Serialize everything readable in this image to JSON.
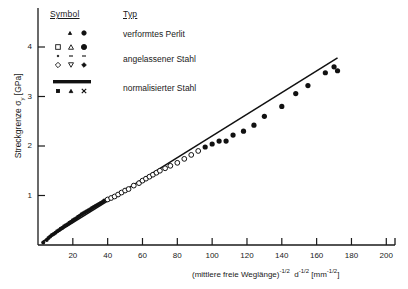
{
  "chart_data": {
    "type": "scatter",
    "title": "",
    "xlabel": "(mittlere freie Weglänge)-1/2  d-1/2 [mm-1/2]",
    "xlabel_parts": {
      "base1": "(mittlere freie Weglänge)",
      "exp1": "-1/2",
      "base2": "d",
      "exp2": "-1/2",
      "unit_open": "[mm",
      "unit_exp": "-1/2",
      "unit_close": "]"
    },
    "ylabel": "Streckgrenze σy [GPa]",
    "ylabel_parts": {
      "base": "Streckgrenze σ",
      "sub": "y",
      "unit": " [GPa]"
    },
    "xlim": [
      0,
      205
    ],
    "ylim": [
      0,
      4.35
    ],
    "xticks": [
      20,
      40,
      60,
      80,
      100,
      120,
      140,
      160,
      180,
      200
    ],
    "yticks": [
      1,
      2,
      3,
      4
    ],
    "grid": false,
    "legend_position": "upper-left-inside",
    "trendline": {
      "x": [
        3,
        172
      ],
      "y": [
        0.08,
        3.78
      ],
      "slope": 0.0219,
      "intercept": 0.014
    },
    "series": [
      {
        "name": "verformtes Perlit",
        "marker": "filled-small",
        "points": [
          [
            3,
            0.05
          ],
          [
            5,
            0.1
          ],
          [
            6,
            0.14
          ],
          [
            7,
            0.17
          ],
          [
            8,
            0.2
          ],
          [
            9,
            0.22
          ],
          [
            10,
            0.25
          ],
          [
            11,
            0.28
          ],
          [
            12,
            0.3
          ],
          [
            13,
            0.33
          ],
          [
            14,
            0.35
          ],
          [
            15,
            0.38
          ],
          [
            16,
            0.4
          ],
          [
            17,
            0.42
          ],
          [
            18,
            0.45
          ],
          [
            19,
            0.47
          ],
          [
            20,
            0.5
          ],
          [
            21,
            0.52
          ],
          [
            22,
            0.54
          ],
          [
            23,
            0.57
          ],
          [
            24,
            0.59
          ],
          [
            25,
            0.62
          ],
          [
            26,
            0.64
          ],
          [
            27,
            0.66
          ],
          [
            28,
            0.68
          ],
          [
            29,
            0.7
          ],
          [
            30,
            0.72
          ],
          [
            31,
            0.75
          ],
          [
            32,
            0.77
          ],
          [
            33,
            0.79
          ],
          [
            34,
            0.81
          ],
          [
            35,
            0.83
          ],
          [
            36,
            0.85
          ],
          [
            37,
            0.87
          ],
          [
            38,
            0.9
          ]
        ]
      },
      {
        "name": "angelassener Stahl",
        "marker": "open",
        "points": [
          [
            40,
            0.92
          ],
          [
            42,
            0.95
          ],
          [
            44,
            0.98
          ],
          [
            46,
            1.02
          ],
          [
            48,
            1.06
          ],
          [
            50,
            1.1
          ],
          [
            52,
            1.13
          ],
          [
            55,
            1.2
          ],
          [
            58,
            1.25
          ],
          [
            60,
            1.3
          ],
          [
            62,
            1.34
          ],
          [
            64,
            1.38
          ],
          [
            66,
            1.42
          ],
          [
            68,
            1.46
          ],
          [
            70,
            1.5
          ],
          [
            73,
            1.55
          ],
          [
            76,
            1.6
          ],
          [
            80,
            1.66
          ],
          [
            84,
            1.74
          ],
          [
            88,
            1.82
          ],
          [
            92,
            1.9
          ]
        ]
      },
      {
        "name": "normalisierter Stahl",
        "marker": "filled",
        "points": [
          [
            96,
            1.98
          ],
          [
            100,
            2.04
          ],
          [
            104,
            2.1
          ],
          [
            108,
            2.1
          ],
          [
            112,
            2.22
          ],
          [
            118,
            2.3
          ],
          [
            124,
            2.42
          ],
          [
            130,
            2.6
          ],
          [
            140,
            2.8
          ],
          [
            148,
            3.06
          ],
          [
            155,
            3.22
          ],
          [
            165,
            3.48
          ],
          [
            170,
            3.6
          ],
          [
            172,
            3.52
          ]
        ]
      }
    ],
    "legend": {
      "header_symbol": "Symbol",
      "header_typ": "Typ",
      "entries": [
        {
          "label": "verformtes Perlit",
          "symbols": [
            "filled-tri-small",
            "filled-circle-small"
          ]
        },
        {
          "label": "angelassener Stahl",
          "symbols": [
            "open-square",
            "open-triangle",
            "filled-circle",
            "dot",
            "dash",
            "dash",
            "open-diamond",
            "open-inv-triangle",
            "filled-diamond"
          ]
        },
        {
          "label": "normalisierter Stahl",
          "symbols": [
            "thick-bar",
            "filled-square-small",
            "filled-triangle-small",
            "cross-small"
          ]
        }
      ]
    }
  }
}
